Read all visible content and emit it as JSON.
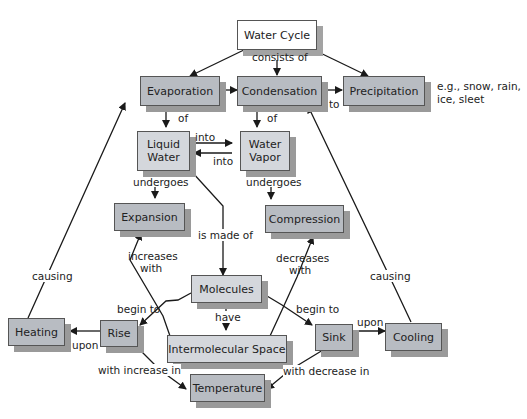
{
  "diagram": {
    "title": "Water Cycle",
    "nodes": {
      "water_cycle": "Water Cycle",
      "evaporation": "Evaporation",
      "condensation": "Condensation",
      "precipitation": "Precipitation",
      "liquid_water_1": "Liquid",
      "liquid_water_2": "Water",
      "water_vapor_1": "Water",
      "water_vapor_2": "Vapor",
      "expansion": "Expansion",
      "compression": "Compression",
      "molecules": "Molecules",
      "intermolecular_space": "Intermolecular Space",
      "heating": "Heating",
      "rise": "Rise",
      "sink": "Sink",
      "cooling": "Cooling",
      "temperature": "Temperature"
    },
    "link_labels": {
      "consists_of": "consists of",
      "to": "to",
      "of_evap": "of",
      "of_cond": "of",
      "into_top": "into",
      "into_bottom": "into",
      "undergoes_left": "undergoes",
      "undergoes_right": "undergoes",
      "is_made_of": "is made of",
      "increases_with_1": "increases",
      "increases_with_2": "with",
      "decreases_with_1": "decreases",
      "decreases_with_2": "with",
      "causing_left": "causing",
      "causing_right": "causing",
      "begin_to_left": "begin to",
      "begin_to_right": "begin to",
      "have": "have",
      "upon_left": "upon",
      "upon_right": "upon",
      "with_increase_in": "with increase in",
      "with_decrease_in": "with decrease in"
    },
    "precipitation_note_1": "e.g., snow, rain,",
    "precipitation_note_2": "ice, sleet"
  },
  "colors": {
    "dark_box": "#b8bcc2",
    "light_box": "#d4d7dc",
    "shadow": "#9a9a9a",
    "line": "#1a1a1a"
  }
}
